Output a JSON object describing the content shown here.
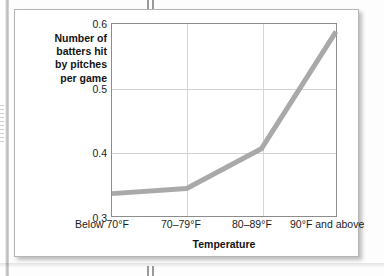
{
  "chart_data": {
    "type": "line",
    "title": "",
    "subtitle": "",
    "xlabel": "Temperature",
    "ylabel": "Number of batters hit by pitches per game",
    "ylabel_lines": [
      "Number of",
      "batters hit",
      "by pitches",
      "per game"
    ],
    "categories": [
      "Below 70°F",
      "70–79°F",
      "80–89°F",
      "90°F and above"
    ],
    "values": [
      0.335,
      0.343,
      0.405,
      0.588
    ],
    "series": [
      {
        "name": "Batters hit by pitches per game",
        "values": [
          0.335,
          0.343,
          0.405,
          0.588
        ],
        "color": "#a9a9a9"
      }
    ],
    "ylim": [
      0.3,
      0.6
    ],
    "yticks": [
      0.3,
      0.4,
      0.5,
      0.6
    ],
    "ytick_labels": [
      "0.3",
      "0.4",
      "0.5",
      "0.6"
    ],
    "grid": "horizontal-and-vertical",
    "legend": "none",
    "line_width_px": 5,
    "annotations": []
  },
  "figure": {
    "line_color": "#a9a9a9",
    "grid_color": "#d3d3d3",
    "frame_color": "#8c8c8c",
    "text_color": "#1c1c1c",
    "background": "#ffffff"
  }
}
